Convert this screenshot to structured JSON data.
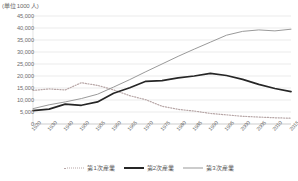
{
  "chart_data": {
    "type": "line",
    "title": "",
    "unit_label": "(単位 1000 人)",
    "xlabel": "",
    "ylabel": "",
    "ylim": [
      0,
      45000
    ],
    "ytick_step": 5000,
    "grid": true,
    "legend_position": "bottom",
    "categories": [
      "1920",
      "1930",
      "1940",
      "1950",
      "1955",
      "1960",
      "1965",
      "1970",
      "1975",
      "1980",
      "1985",
      "1990",
      "1995",
      "2000",
      "2005",
      "2010",
      "2015"
    ],
    "yticks": [
      "45,000",
      "40,000",
      "35,000",
      "30,000",
      "25,000",
      "20,000",
      "15,000",
      "10,000",
      "5,000",
      "0"
    ],
    "series": [
      {
        "name": "第1次産業",
        "style": "dotted",
        "color": "#b7a6a6",
        "values": [
          14000,
          14600,
          14200,
          17200,
          16100,
          14200,
          11800,
          10100,
          7400,
          6100,
          5400,
          4400,
          3800,
          3200,
          2900,
          2600,
          2400
        ]
      },
      {
        "name": "第2次産業",
        "style": "solid-thick",
        "color": "#262626",
        "values": [
          5600,
          6200,
          8300,
          7800,
          9200,
          12800,
          15100,
          17800,
          18100,
          19200,
          20000,
          21100,
          20200,
          18600,
          16500,
          14800,
          13500
        ]
      },
      {
        "name": "第3次産業",
        "style": "solid",
        "color": "#9a9a9a",
        "values": [
          6400,
          8000,
          9200,
          10600,
          12400,
          15400,
          18500,
          21800,
          25000,
          28200,
          31200,
          34100,
          37000,
          38600,
          39200,
          38800,
          39500
        ]
      }
    ]
  },
  "legend": {
    "items": [
      {
        "label": "第1次産業"
      },
      {
        "label": "第2次産業"
      },
      {
        "label": "第3次産業"
      }
    ]
  }
}
